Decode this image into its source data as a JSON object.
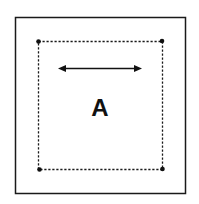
{
  "diagram": {
    "label": "A",
    "arrow": "double-headed horizontal arrow",
    "colors": {
      "stroke": "#1a1a1a",
      "background": "#ffffff"
    }
  }
}
